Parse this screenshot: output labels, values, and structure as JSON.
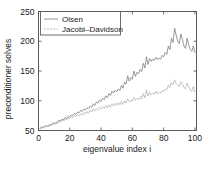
{
  "chart_data": {
    "type": "line",
    "title": "",
    "xlabel": "eigenvalue index i",
    "ylabel": "preconditioner solves",
    "xlim": [
      0,
      101
    ],
    "ylim": [
      50,
      250
    ],
    "xticks": [
      0,
      20,
      40,
      60,
      80,
      100
    ],
    "xtick_labels": [
      "0",
      "20",
      "40",
      "60",
      "80",
      "100"
    ],
    "yticks": [
      50,
      100,
      150,
      200,
      250
    ],
    "ytick_labels": [
      "50",
      "100",
      "150",
      "200",
      "250"
    ],
    "grid": false,
    "legend_position": "top-left-inside",
    "x": [
      1,
      2,
      3,
      4,
      5,
      6,
      7,
      8,
      9,
      10,
      11,
      12,
      13,
      14,
      15,
      16,
      17,
      18,
      19,
      20,
      21,
      22,
      23,
      24,
      25,
      26,
      27,
      28,
      29,
      30,
      31,
      32,
      33,
      34,
      35,
      36,
      37,
      38,
      39,
      40,
      41,
      42,
      43,
      44,
      45,
      46,
      47,
      48,
      49,
      50,
      51,
      52,
      53,
      54,
      55,
      56,
      57,
      58,
      59,
      60,
      61,
      62,
      63,
      64,
      65,
      66,
      67,
      68,
      69,
      70,
      71,
      72,
      73,
      74,
      75,
      76,
      77,
      78,
      79,
      80,
      81,
      82,
      83,
      84,
      85,
      86,
      87,
      88,
      89,
      90,
      91,
      92,
      93,
      94,
      95,
      96,
      97,
      98,
      99,
      100
    ],
    "series": [
      {
        "name": "Olsen",
        "style": "solid",
        "color": "#777777",
        "values": [
          54,
          56,
          55,
          57,
          58,
          57,
          60,
          59,
          62,
          63,
          61,
          65,
          67,
          66,
          69,
          68,
          72,
          70,
          74,
          73,
          76,
          75,
          79,
          77,
          81,
          80,
          84,
          82,
          86,
          85,
          88,
          87,
          91,
          89,
          95,
          92,
          98,
          96,
          101,
          99,
          104,
          102,
          108,
          105,
          112,
          109,
          116,
          113,
          118,
          115,
          120,
          117,
          126,
          121,
          131,
          128,
          142,
          133,
          139,
          136,
          150,
          141,
          148,
          145,
          153,
          149,
          163,
          155,
          174,
          161,
          171,
          166,
          170,
          168,
          173,
          169,
          172,
          170,
          176,
          174,
          181,
          178,
          192,
          186,
          205,
          198,
          222,
          210,
          200,
          196,
          212,
          203,
          192,
          188,
          205,
          194,
          186,
          183,
          192,
          181
        ]
      },
      {
        "name": "Jacobi-Davidson",
        "style": "dashed",
        "color": "#999999",
        "values": [
          53,
          54,
          55,
          56,
          57,
          56,
          59,
          58,
          61,
          60,
          63,
          62,
          65,
          64,
          67,
          66,
          69,
          68,
          71,
          70,
          73,
          71,
          75,
          73,
          77,
          75,
          78,
          76,
          80,
          78,
          82,
          79,
          84,
          81,
          86,
          83,
          87,
          84,
          89,
          86,
          90,
          87,
          92,
          88,
          93,
          89,
          95,
          91,
          96,
          92,
          97,
          93,
          99,
          94,
          100,
          96,
          103,
          98,
          101,
          99,
          106,
          101,
          104,
          102,
          107,
          103,
          112,
          105,
          118,
          108,
          115,
          110,
          113,
          111,
          116,
          112,
          114,
          113,
          117,
          115,
          120,
          118,
          126,
          122,
          131,
          127,
          135,
          129,
          126,
          124,
          132,
          128,
          122,
          120,
          130,
          124,
          118,
          116,
          124,
          114
        ]
      }
    ]
  },
  "legend": {
    "entries": [
      {
        "label": "Olsen"
      },
      {
        "label": "Jacobi–Davidson"
      }
    ]
  }
}
